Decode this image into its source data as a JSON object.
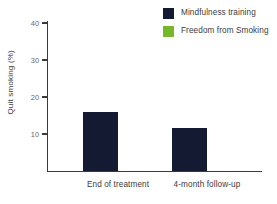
{
  "chart_data": {
    "type": "bar",
    "title": "",
    "subtitle": "",
    "xlabel": "",
    "ylabel": "Quit smoking (%)",
    "categories": [
      "End of treatment",
      "4-month follow-up"
    ],
    "series": [
      {
        "name": "Mindfulness training",
        "color": "#151a33",
        "values": [
          36,
          31.5
        ]
      },
      {
        "name": "Freedom from Smoking",
        "color": "#76b82a",
        "values": [
          16,
          8
        ]
      }
    ],
    "ylim": [
      0,
      40
    ],
    "yticks": [
      10,
      20,
      30,
      40
    ],
    "ytick_labels": [
      "10",
      "20",
      "30",
      "40"
    ],
    "grid": false,
    "legend_position": "top-right"
  },
  "legend": {
    "items": [
      {
        "label": "Mindfulness training",
        "color": "#151a33",
        "icon": "square-swatch-icon"
      },
      {
        "label": "Freedom from Smoking",
        "color": "#76b82a",
        "icon": "square-swatch-icon"
      }
    ]
  },
  "axes": {
    "y_title": "Quit smoking (%)",
    "y_tick_40": "40",
    "y_tick_30": "30",
    "y_tick_20": "20",
    "y_tick_10": "10",
    "axis_color": "#3a3a3a"
  },
  "categories": {
    "cat_0": "End of treatment",
    "cat_1": "4-month follow-up"
  }
}
